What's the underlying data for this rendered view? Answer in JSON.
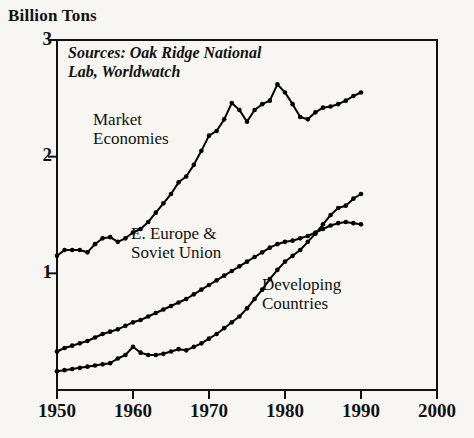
{
  "chart_data": {
    "type": "line",
    "title": "",
    "ylabel": "Billion Tons",
    "xlabel": "",
    "xlim": [
      1950,
      2000
    ],
    "ylim": [
      0,
      3
    ],
    "yticks": [
      1,
      2,
      3
    ],
    "xticks": [
      1950,
      1960,
      1970,
      1980,
      1990,
      2000
    ],
    "grid": false,
    "legend_position": "inline-annotations",
    "annotations": [
      {
        "name": "source-note",
        "text": "Sources: Oak Ridge National Lab, Worldwatch"
      },
      {
        "name": "market-economies-label",
        "text": "Market\nEconomies"
      },
      {
        "name": "e-europe-soviet-union-label",
        "text": "E. Europe &\nSoviet Union"
      },
      {
        "name": "developing-countries-label",
        "text": "Developing\nCountries"
      }
    ],
    "series": [
      {
        "name": "Market Economies",
        "x": [
          1950,
          1951,
          1952,
          1953,
          1954,
          1955,
          1956,
          1957,
          1958,
          1959,
          1960,
          1961,
          1962,
          1963,
          1964,
          1965,
          1966,
          1967,
          1968,
          1969,
          1970,
          1971,
          1972,
          1973,
          1974,
          1975,
          1976,
          1977,
          1978,
          1979,
          1980,
          1981,
          1982,
          1983,
          1984,
          1985,
          1986,
          1987,
          1988,
          1989,
          1990
        ],
        "values": [
          1.15,
          1.2,
          1.2,
          1.2,
          1.18,
          1.25,
          1.3,
          1.31,
          1.27,
          1.3,
          1.35,
          1.38,
          1.44,
          1.52,
          1.6,
          1.68,
          1.78,
          1.83,
          1.93,
          2.05,
          2.18,
          2.22,
          2.32,
          2.46,
          2.4,
          2.3,
          2.4,
          2.45,
          2.48,
          2.62,
          2.55,
          2.45,
          2.34,
          2.32,
          2.38,
          2.42,
          2.43,
          2.45,
          2.48,
          2.52,
          2.55
        ]
      },
      {
        "name": "E. Europe & Soviet Union",
        "x": [
          1950,
          1951,
          1952,
          1953,
          1954,
          1955,
          1956,
          1957,
          1958,
          1959,
          1960,
          1961,
          1962,
          1963,
          1964,
          1965,
          1966,
          1967,
          1968,
          1969,
          1970,
          1971,
          1972,
          1973,
          1974,
          1975,
          1976,
          1977,
          1978,
          1979,
          1980,
          1981,
          1982,
          1983,
          1984,
          1985,
          1986,
          1987,
          1988,
          1989,
          1990
        ],
        "values": [
          0.33,
          0.36,
          0.38,
          0.4,
          0.42,
          0.45,
          0.48,
          0.5,
          0.52,
          0.55,
          0.58,
          0.6,
          0.63,
          0.66,
          0.69,
          0.72,
          0.75,
          0.78,
          0.82,
          0.86,
          0.9,
          0.94,
          0.98,
          1.02,
          1.06,
          1.1,
          1.14,
          1.18,
          1.22,
          1.25,
          1.27,
          1.28,
          1.3,
          1.32,
          1.35,
          1.38,
          1.41,
          1.43,
          1.44,
          1.43,
          1.42
        ]
      },
      {
        "name": "Developing Countries",
        "x": [
          1950,
          1951,
          1952,
          1953,
          1954,
          1955,
          1956,
          1957,
          1958,
          1959,
          1960,
          1961,
          1962,
          1963,
          1964,
          1965,
          1966,
          1967,
          1968,
          1969,
          1970,
          1971,
          1972,
          1973,
          1974,
          1975,
          1976,
          1977,
          1978,
          1979,
          1980,
          1981,
          1982,
          1983,
          1984,
          1985,
          1986,
          1987,
          1988,
          1989,
          1990
        ],
        "values": [
          0.16,
          0.17,
          0.18,
          0.19,
          0.2,
          0.21,
          0.22,
          0.23,
          0.27,
          0.3,
          0.37,
          0.32,
          0.3,
          0.3,
          0.31,
          0.33,
          0.35,
          0.34,
          0.37,
          0.4,
          0.44,
          0.48,
          0.53,
          0.58,
          0.63,
          0.7,
          0.78,
          0.86,
          0.95,
          1.03,
          1.1,
          1.15,
          1.2,
          1.27,
          1.34,
          1.42,
          1.5,
          1.56,
          1.58,
          1.64,
          1.68
        ]
      }
    ]
  },
  "axis": {
    "y_title": "Billion Tons",
    "y_tick_labels": [
      "3",
      "2",
      "1"
    ],
    "x_tick_labels": [
      "1950",
      "1960",
      "1970",
      "1980",
      "1990",
      "2000"
    ]
  },
  "labels": {
    "source_note": "Sources: Oak Ridge National\nLab, Worldwatch",
    "market_economies": "Market\nEconomies",
    "e_europe_soviet_union": "E. Europe &\nSoviet Union",
    "developing_countries": "Developing\nCountries"
  },
  "colors": {
    "background": "#f7f6f2",
    "ink": "#111111",
    "line": "#000000"
  }
}
